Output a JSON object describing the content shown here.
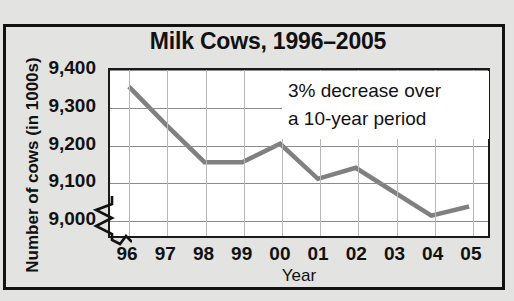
{
  "chart_data": {
    "type": "line",
    "title": "Milk Cows, 1996–2005",
    "xlabel": "Year",
    "ylabel": "Number of cows (in 1000s)",
    "categories": [
      "96",
      "97",
      "98",
      "99",
      "00",
      "01",
      "02",
      "03",
      "04",
      "05"
    ],
    "values": [
      9355,
      9250,
      9150,
      9150,
      9200,
      9105,
      9135,
      9070,
      9005,
      9030
    ],
    "series": [
      {
        "name": "Number of cows",
        "values": [
          9355,
          9250,
          9150,
          9150,
          9200,
          9105,
          9135,
          9070,
          9005,
          9030
        ]
      }
    ],
    "ylim": [
      8950,
      9400
    ],
    "yticks": [
      9000,
      9100,
      9200,
      9300,
      9400
    ],
    "ytick_labels": [
      "9,000",
      "9,100",
      "9,200",
      "9,300",
      "9,400"
    ],
    "grid": true,
    "legend": "none",
    "axis_break": "y-axis break below 9,000",
    "annotations": [
      {
        "line1": "3% decrease over",
        "line2": "a 10-year period"
      }
    ],
    "colors": {
      "line": "#808080",
      "plot_background": "#ffffff",
      "page_background": "#e3e3e1",
      "frame": "#121212",
      "hgrid": "#8c8c8c",
      "vgrid": "#b9b9b9",
      "text": "#111111"
    }
  }
}
